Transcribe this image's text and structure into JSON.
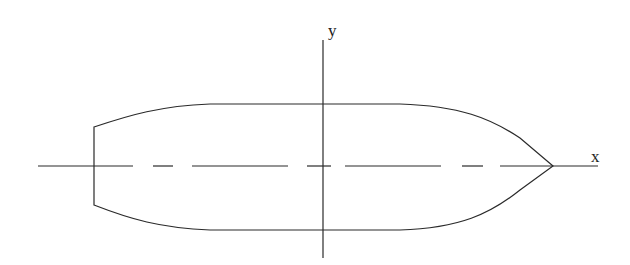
{
  "diagram": {
    "type": "hull-planform",
    "colors": {
      "stroke": "#2a2a2a",
      "background": "#ffffff"
    },
    "axes": {
      "x_label": "x",
      "y_label": "y"
    },
    "centerline": {
      "style": "dash-long-short"
    },
    "hull": {
      "stern": "transom (flat)",
      "bow": "pointed"
    }
  }
}
